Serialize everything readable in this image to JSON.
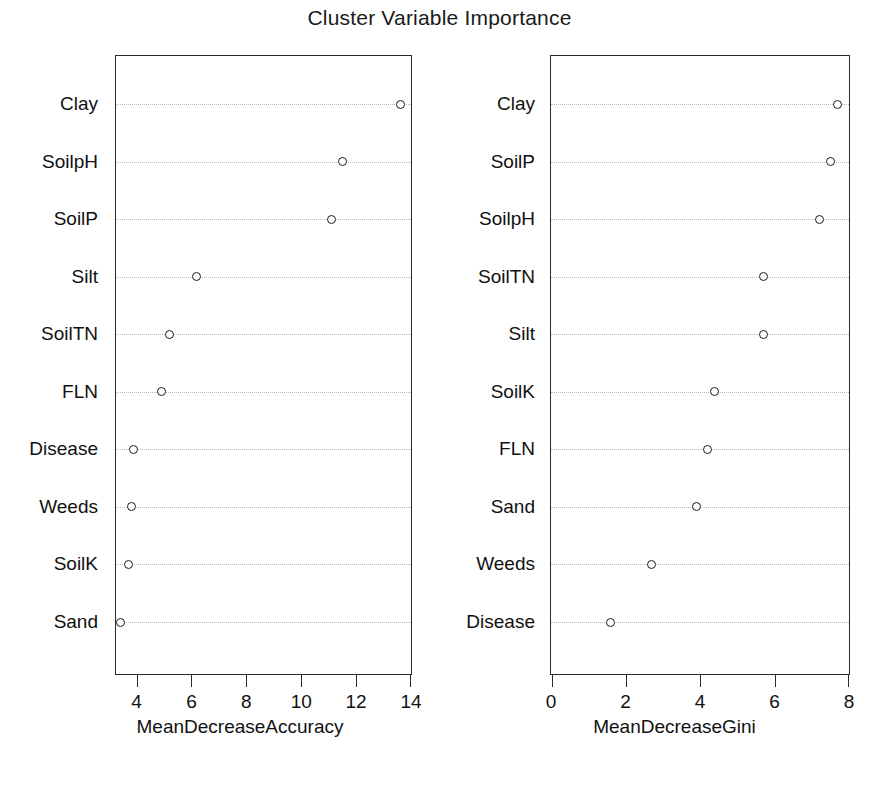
{
  "chart_data": {
    "type": "scatter",
    "title": "Cluster Variable Importance",
    "layout": "two side-by-side dotcharts (randomForest varImpPlot style)",
    "grid": "horizontal dotted gridlines, one per category",
    "legend": "none",
    "panels": [
      {
        "id": "left",
        "xlabel": "MeanDecreaseAccuracy",
        "ylabel": "",
        "xlim": [
          3.25,
          14.0
        ],
        "xticks": [
          4,
          6,
          8,
          10,
          12,
          14
        ],
        "xticklabels": [
          "4",
          "6",
          "8",
          "10",
          "12",
          "14"
        ],
        "categories": [
          "Clay",
          "SoilpH",
          "SoilP",
          "Silt",
          "SoilTN",
          "FLN",
          "Disease",
          "Weeds",
          "SoilK",
          "Sand"
        ],
        "values": [
          13.6,
          11.5,
          11.1,
          6.2,
          5.2,
          4.9,
          3.9,
          3.8,
          3.7,
          3.4
        ]
      },
      {
        "id": "right",
        "xlabel": "MeanDecreaseGini",
        "ylabel": "",
        "xlim": [
          0.0,
          8.0
        ],
        "xticks": [
          0,
          2,
          4,
          6,
          8
        ],
        "xticklabels": [
          "0",
          "2",
          "4",
          "6",
          "8"
        ],
        "categories": [
          "Clay",
          "SoilP",
          "SoilpH",
          "SoilTN",
          "Silt",
          "SoilK",
          "FLN",
          "Sand",
          "Weeds",
          "Disease"
        ],
        "values": [
          7.7,
          7.5,
          7.2,
          5.7,
          5.7,
          4.4,
          4.2,
          3.9,
          2.7,
          1.6
        ]
      }
    ]
  },
  "colors": {
    "background": "#ffffff",
    "axis": "#2b2b2b",
    "text": "#111111",
    "grid": "#b9b9b9",
    "point_stroke": "#1c1c1c"
  }
}
